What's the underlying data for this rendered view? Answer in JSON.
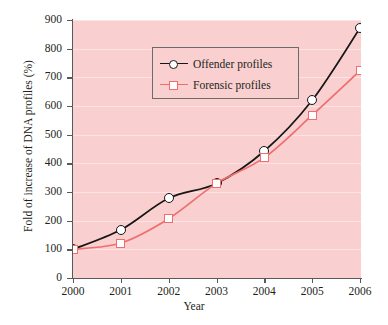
{
  "chart_data": {
    "type": "line",
    "title": "",
    "xlabel": "Year",
    "ylabel": "Fold of increase of DNA profiles (%)",
    "x": [
      2000,
      2001,
      2002,
      2003,
      2004,
      2005,
      2006
    ],
    "xticklabels": [
      "2000",
      "2001",
      "2002",
      "2003",
      "2004",
      "2005",
      "2006"
    ],
    "yticklabels": [
      "0",
      "100",
      "200",
      "300",
      "400",
      "500",
      "600",
      "700",
      "800",
      "900"
    ],
    "ylim": [
      0,
      900
    ],
    "xlim": [
      2000,
      2006
    ],
    "ytick_step": 100,
    "grid": "horizontal",
    "legend_position": "top-left",
    "series": [
      {
        "name": "Offender profiles",
        "marker": "circle",
        "color": "#161616",
        "values": [
          100,
          168,
          278,
          330,
          443,
          620,
          872
        ]
      },
      {
        "name": "Forensic profiles",
        "marker": "square",
        "color": "#ef6e6e",
        "values": [
          100,
          122,
          207,
          330,
          420,
          568,
          723
        ]
      }
    ],
    "plot_background": "#f9cfcf",
    "gridline_color": "#fde3e3",
    "axis_color": "#595959"
  }
}
